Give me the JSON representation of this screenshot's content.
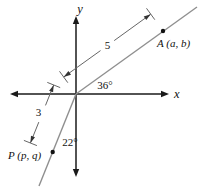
{
  "figure": {
    "type": "trigonometry-coordinate-diagram",
    "background": "#ffffff",
    "axis_color": "#1a1a1a",
    "ray_color": "#8f8f8f",
    "dimension_color": "#666666",
    "text_color": "#111111"
  },
  "axes": {
    "x_label": "x",
    "y_label": "y"
  },
  "points": [
    {
      "name": "A",
      "label": "A (a, b)",
      "quadrant": "I"
    },
    {
      "name": "P",
      "label": "P (p, q)",
      "quadrant": "III"
    }
  ],
  "measurements": [
    {
      "name": "origin-to-A-distance",
      "value": "5"
    },
    {
      "name": "origin-to-P-distance",
      "value": "3"
    }
  ],
  "angles": [
    {
      "name": "ray-OA-from-positive-x-axis",
      "value": "36°"
    },
    {
      "name": "ray-OP-from-negative-y-axis",
      "value": "22°"
    }
  ]
}
